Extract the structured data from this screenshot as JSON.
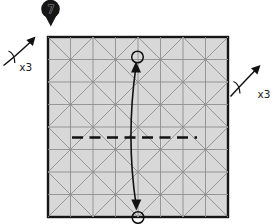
{
  "step_badge": {
    "number": "7",
    "shape": "map-pin",
    "color": "#161616"
  },
  "repeat_left": {
    "label": "x3"
  },
  "repeat_right": {
    "label": "x3"
  },
  "diagram": {
    "type": "origami-crease-pattern-step",
    "paper": {
      "fill": "#d8d8d8",
      "border_color": "#161616",
      "crease_color": "#8f8f8f",
      "grid_divisions": 8,
      "diagonals": "both 45-degree directions, spaced every 2 cells (X in each 2x2 block)"
    },
    "fold_line": {
      "style": "dashed (valley fold)",
      "orientation": "horizontal",
      "color": "#101010"
    },
    "arrow": {
      "type": "double-headed curved fold arrow",
      "color": "#111111",
      "endpoint_markers": "small circles at top point and bottom-edge midpoint"
    }
  }
}
